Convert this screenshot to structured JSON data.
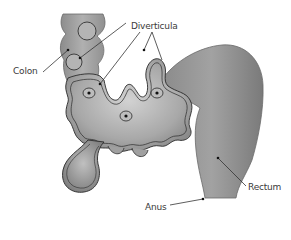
{
  "diagram": {
    "labels": {
      "colon": "Colon",
      "diverticula": "Diverticula",
      "rectum": "Rectum",
      "anus": "Anus"
    },
    "colors": {
      "tissue_light": "#c8c8c8",
      "tissue_mid": "#9a9a9a",
      "tissue_dark": "#6e6e6e",
      "outline": "#2a2a2a",
      "leader_line": "#333333",
      "text": "#3a3a3a",
      "background": "#ffffff"
    }
  }
}
